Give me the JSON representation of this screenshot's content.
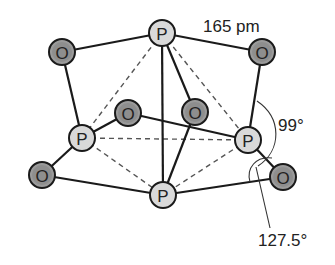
{
  "diagram": {
    "atoms": [
      {
        "id": "P_top",
        "element": "P",
        "label": "P",
        "x": 162,
        "y": 33
      },
      {
        "id": "P_left",
        "element": "P",
        "label": "P",
        "x": 82,
        "y": 138
      },
      {
        "id": "P_right",
        "element": "P",
        "label": "P",
        "x": 248,
        "y": 140
      },
      {
        "id": "P_bottom",
        "element": "P",
        "label": "P",
        "x": 163,
        "y": 195
      },
      {
        "id": "O_tl",
        "element": "O",
        "label": "O",
        "x": 62,
        "y": 52
      },
      {
        "id": "O_tr",
        "element": "O",
        "label": "O",
        "x": 262,
        "y": 52
      },
      {
        "id": "O_il",
        "element": "O",
        "label": "O",
        "x": 128,
        "y": 113
      },
      {
        "id": "O_ir",
        "element": "O",
        "label": "O",
        "x": 195,
        "y": 112
      },
      {
        "id": "O_bl",
        "element": "O",
        "label": "O",
        "x": 42,
        "y": 175
      },
      {
        "id": "O_br",
        "element": "O",
        "label": "O",
        "x": 283,
        "y": 177
      }
    ],
    "bonds": [
      [
        "P_top",
        "O_tl"
      ],
      [
        "O_tl",
        "P_left"
      ],
      [
        "P_top",
        "O_tr"
      ],
      [
        "O_tr",
        "P_right"
      ],
      [
        "P_top",
        "O_ir"
      ],
      [
        "O_ir",
        "P_bottom"
      ],
      [
        "P_top",
        "P_bottom"
      ],
      [
        "P_left",
        "O_il"
      ],
      [
        "O_il",
        "P_right"
      ],
      [
        "P_left",
        "O_bl"
      ],
      [
        "O_bl",
        "P_bottom"
      ],
      [
        "P_right",
        "O_br"
      ],
      [
        "O_br",
        "P_bottom"
      ]
    ],
    "tetrahedron_edges": [
      [
        "P_top",
        "P_left"
      ],
      [
        "P_top",
        "P_right"
      ],
      [
        "P_left",
        "P_right"
      ],
      [
        "P_left",
        "P_bottom"
      ],
      [
        "P_right",
        "P_bottom"
      ]
    ],
    "annotations": {
      "bond_length": {
        "text": "165 pm",
        "x": 203,
        "y": 32
      },
      "angle_small": {
        "text": "99°",
        "x": 278,
        "y": 131
      },
      "angle_large": {
        "text": "127.5°",
        "x": 258,
        "y": 246
      }
    },
    "colors": {
      "P_fill": "#d9d9d9",
      "O_fill": "#9b9b9b",
      "outline": "#1a1a1a"
    }
  }
}
